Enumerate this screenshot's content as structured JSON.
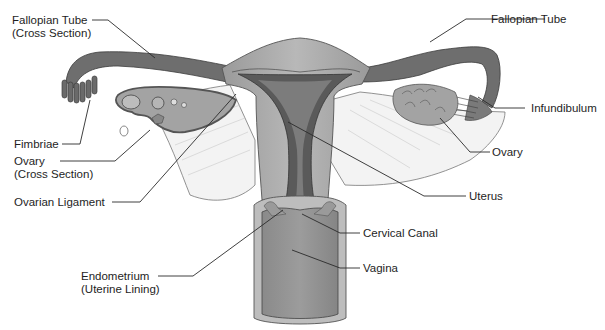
{
  "diagram": {
    "labels": {
      "fallopian_tube_cross": {
        "line1": "Fallopian Tube",
        "line2": "(Cross Section)"
      },
      "fimbriae": {
        "line1": "Fimbriae"
      },
      "ovary_cross": {
        "line1": "Ovary",
        "line2": "(Cross Section)"
      },
      "ovarian_ligament": {
        "line1": "Ovarian Ligament"
      },
      "endometrium": {
        "line1": "Endometrium",
        "line2": "(Uterine Lining)"
      },
      "fallopian_tube": {
        "line1": "Fallopian Tube"
      },
      "infundibulum": {
        "line1": "Infundibulum"
      },
      "ovary": {
        "line1": "Ovary"
      },
      "uterus": {
        "line1": "Uterus"
      },
      "cervical_canal": {
        "line1": "Cervical Canal"
      },
      "vagina": {
        "line1": "Vagina"
      }
    },
    "colors": {
      "tube_dark": "#6e6e6e",
      "tube_mid": "#8f8f8f",
      "uterus_wall": "#a9a9a9",
      "uterus_outer": "#c4c4c4",
      "cavity": "#555555",
      "ligament": "#f2f2f2",
      "vagina": "#8c8c8c",
      "ovary": "#a3a3a3",
      "line": "#2a2a2a"
    }
  }
}
